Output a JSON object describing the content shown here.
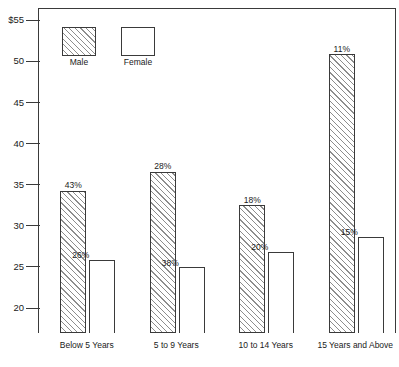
{
  "chart_data": {
    "type": "bar",
    "title": "",
    "xlabel": "",
    "ylabel": "",
    "categories": [
      "Below 5 Years",
      "5 to 9 Years",
      "10 to 14 Years",
      "15 Years and Above"
    ],
    "series": [
      {
        "name": "Male",
        "values": [
          34.3,
          36.6,
          32.5,
          50.9
        ],
        "labels": [
          "43%",
          "28%",
          "18%",
          "11%"
        ]
      },
      {
        "name": "Female",
        "values": [
          25.9,
          25.0,
          26.9,
          28.7
        ],
        "labels": [
          "26%",
          "38%",
          "20%",
          "15%"
        ]
      }
    ],
    "ylim": [
      17.0,
      56.5
    ],
    "yticks": [
      20,
      25,
      30,
      35,
      40,
      45,
      50,
      55
    ],
    "ytick_labels": [
      "20",
      "25",
      "30",
      "35",
      "40",
      "45",
      "50",
      "$55"
    ],
    "grid": false,
    "legend_position": "top-left",
    "legend": [
      "Male",
      "Female"
    ],
    "colors": {
      "outline": "#3a3a3a",
      "male_hatch": "#8d8d8d",
      "female_fill": "#ffffff",
      "text": "#1a1a1a"
    }
  }
}
